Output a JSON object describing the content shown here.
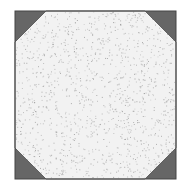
{
  "figure": {
    "square": {
      "x": 15,
      "y": 11,
      "width": 161,
      "height": 168
    },
    "corner_leg": 31,
    "colors": {
      "corner_fill": "#666666",
      "interior_fill": "#f2f2f2",
      "stipple": "#9a9a9a",
      "outline": "#444444"
    },
    "stipple_density": 1400
  }
}
